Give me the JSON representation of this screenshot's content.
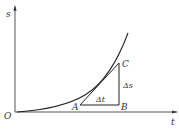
{
  "diagram": {
    "axes": {
      "y_label": "s",
      "x_label": "t",
      "origin_label": "O"
    },
    "points": {
      "A": "A",
      "B": "B",
      "C": "C"
    },
    "increments": {
      "delta_t": "Δt",
      "delta_s": "Δs"
    },
    "colors": {
      "ink": "#333333",
      "background": "#ffffff"
    }
  }
}
